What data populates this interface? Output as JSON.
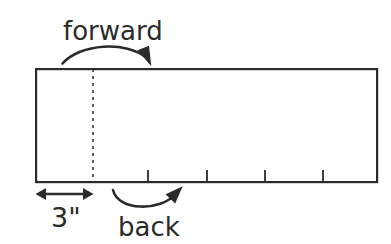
{
  "figure": {
    "type": "technical-diagram",
    "background_color": "#ffffff",
    "stroke_color": "#2b2b2b",
    "labels": {
      "forward": "forward",
      "back": "back",
      "dimension": "3\""
    },
    "board": {
      "x": 35,
      "y": 68,
      "width": 343,
      "height": 115,
      "stroke_width": 2.2
    },
    "dashed_line": {
      "x": 93,
      "y_top": 68,
      "y_bottom": 183,
      "dash_pattern": "3 4",
      "stroke_width": 1.6
    },
    "tick_marks": {
      "count": 4,
      "x_positions": [
        148,
        207,
        265,
        323
      ],
      "length": 12,
      "stroke_width": 1.8,
      "anchor_edge": "bottom"
    },
    "dimension_arrow": {
      "x_start": 36,
      "x_end": 93,
      "y": 194,
      "heads": "both",
      "stroke_width": 2.4
    },
    "forward_arrow": {
      "start_x": 62,
      "start_y": 63,
      "end_x": 149,
      "end_y": 64,
      "peak_y": 45,
      "head": "end",
      "direction": "right",
      "stroke_width": 2.6
    },
    "back_arrow": {
      "start_x": 113,
      "start_y": 190,
      "end_x": 182,
      "end_y": 188,
      "dip_y": 209,
      "head": "end",
      "direction": "up-right",
      "stroke_width": 2.6
    },
    "text_positions": {
      "forward": {
        "x": 63,
        "y": 40
      },
      "back": {
        "x": 118,
        "y": 236
      },
      "dimension": {
        "x": 51,
        "y": 227
      }
    }
  }
}
